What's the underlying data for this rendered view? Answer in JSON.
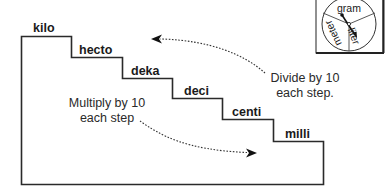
{
  "steps": [
    {
      "label": "kilo"
    },
    {
      "label": "hecto"
    },
    {
      "label": "deka"
    },
    {
      "label": "deci"
    },
    {
      "label": "centi"
    },
    {
      "label": "milli"
    }
  ],
  "annotations": {
    "divide": {
      "line1": "Divide by 10",
      "line2": "each step.",
      "direction": "up-left"
    },
    "multiply": {
      "line1": "Multiply by 10",
      "line2": "each step",
      "direction": "down-right"
    }
  },
  "spinner": {
    "sections": [
      "gram",
      "liter",
      "meter"
    ],
    "needle_points_to": "liter"
  },
  "colors": {
    "ink": "#1a1a1a",
    "background": "#ffffff"
  }
}
